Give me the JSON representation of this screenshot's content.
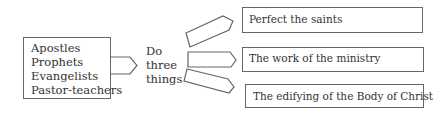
{
  "diagram": {
    "source_group": {
      "items": [
        "Apostles",
        "Prophets",
        "Evangelists",
        "Pastor-teachers"
      ]
    },
    "connector_label": [
      "Do",
      "three",
      "things"
    ],
    "targets": [
      {
        "label": "Perfect the saints"
      },
      {
        "label": "The work of the ministry"
      },
      {
        "label": "The edifying of the Body of Christ"
      }
    ],
    "colors": {
      "stroke": "#666666",
      "text": "#333333",
      "background": "#ffffff"
    }
  }
}
